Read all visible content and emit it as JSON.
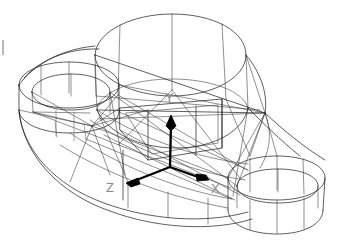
{
  "viewport": {
    "width": 340,
    "height": 251,
    "background": "#ffffff",
    "render_mode": "wireframe",
    "title": "3D CAD wireframe of mechanical bracket"
  },
  "axes": {
    "name": "coordinate-triad",
    "origin": {
      "x": 170,
      "y": 167
    },
    "color": "#000000",
    "label_color": "#8a8a8a",
    "items": [
      {
        "id": "y",
        "label": "Y",
        "tip": {
          "x": 172,
          "y": 118
        },
        "label_pos": {
          "x": 165,
          "y": 102
        }
      },
      {
        "id": "z",
        "label": "Z",
        "tip": {
          "x": 128,
          "y": 182
        },
        "label_pos": {
          "x": 106,
          "y": 192
        }
      },
      {
        "id": "x",
        "label": "X",
        "tip": {
          "x": 205,
          "y": 179
        },
        "label_pos": {
          "x": 212,
          "y": 192
        }
      }
    ]
  },
  "geometry": {
    "features": [
      {
        "id": "main-boss",
        "type": "cylinder",
        "label": "large central cylindrical boss"
      },
      {
        "id": "left-boss",
        "type": "cylinder",
        "label": "left circular boss with bore"
      },
      {
        "id": "right-boss",
        "type": "cylinder",
        "label": "right circular boss with bore"
      },
      {
        "id": "base-plate",
        "type": "curved-slab",
        "label": "curved base plate"
      }
    ],
    "stroke_color": "#1a1a1a",
    "stroke_width": 0.7
  }
}
